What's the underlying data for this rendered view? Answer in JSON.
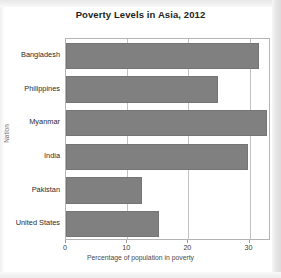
{
  "chart_data": {
    "type": "bar",
    "orientation": "horizontal",
    "title": "Poverty Levels in Asia, 2012",
    "xlabel": "Percentage of population in poverty",
    "ylabel": "Nation",
    "categories": [
      "Bangladesh",
      "Philippines",
      "Myanmar",
      "India",
      "Pakistan",
      "United States"
    ],
    "values": [
      31.5,
      24.8,
      32.8,
      29.8,
      12.4,
      15.2
    ],
    "xlim": [
      0,
      33.5
    ],
    "xticks": [
      "0",
      "10",
      "20",
      "30"
    ],
    "xtick_values": [
      0,
      10,
      20,
      30
    ],
    "grid": "vertical",
    "legend": "none",
    "bar_color": "#808080",
    "bar_edge_color": "#757575",
    "frame_color": "#b4b4b4",
    "gridline_color": "#c2c2c2",
    "title_color": "#232323"
  }
}
